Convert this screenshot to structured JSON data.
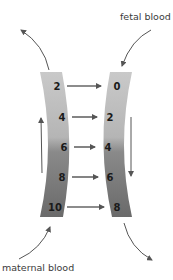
{
  "labels": {
    "fetal": "fetal blood",
    "maternal": "maternal blood"
  },
  "maternal_values": [
    "2",
    "4",
    "6",
    "8",
    "10"
  ],
  "fetal_values": [
    "0",
    "2",
    "4",
    "6",
    "8"
  ],
  "colors": {
    "band_light": "#c8c8c8",
    "band_dark": "#6e6e6e",
    "arrow": "#5a5a5a",
    "text": "#1a1a1a"
  }
}
